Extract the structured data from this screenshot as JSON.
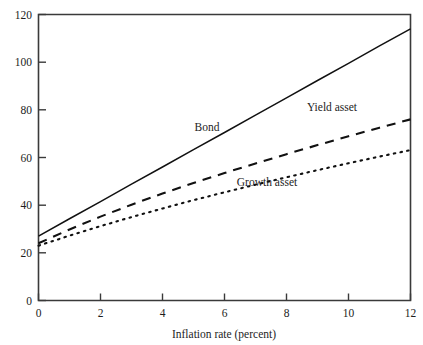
{
  "chart_data": {
    "type": "line",
    "title": "",
    "xlabel": "Inflation rate (percent)",
    "ylabel": "",
    "xlim": [
      0,
      12
    ],
    "ylim": [
      0,
      120
    ],
    "xticks": [
      "0",
      "2",
      "4",
      "6",
      "8",
      "10",
      "12"
    ],
    "yticks": [
      "0",
      "20",
      "40",
      "60",
      "80",
      "100",
      "120"
    ],
    "grid": false,
    "legend_position": "inline-annotations",
    "x": [
      0,
      1,
      2,
      3,
      4,
      5,
      6,
      7,
      8,
      9,
      10,
      11,
      12
    ],
    "series": [
      {
        "name": "Bond",
        "style": "solid",
        "values": [
          27.0,
          34.3,
          41.5,
          48.8,
          56.0,
          63.3,
          70.5,
          77.8,
          85.0,
          92.3,
          99.5,
          106.8,
          114.0
        ]
      },
      {
        "name": "Yield asset",
        "style": "dashed",
        "values": [
          24.0,
          29.8,
          35.2,
          40.2,
          44.9,
          49.3,
          53.5,
          57.5,
          61.4,
          65.2,
          68.9,
          72.5,
          76.0
        ]
      },
      {
        "name": "Growth asset",
        "style": "dotted",
        "values": [
          23.0,
          27.2,
          31.2,
          35.0,
          38.6,
          42.1,
          45.4,
          48.6,
          51.7,
          54.7,
          57.6,
          60.4,
          63.1
        ]
      }
    ],
    "annotations": [
      {
        "text": "Bond",
        "x": 4.6,
        "y": 69
      },
      {
        "text": "Yield asset",
        "x": 9.3,
        "y": 86
      },
      {
        "text": "Growth asset",
        "x": 7.0,
        "y": 45
      }
    ]
  },
  "axis": {
    "x_title": "Inflation rate (percent)"
  }
}
